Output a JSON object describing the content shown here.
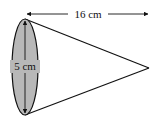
{
  "figure": {
    "type": "cone-diagram",
    "shape": "cone",
    "orientation": "lying on side, base at left, apex at right",
    "length_label": "16 cm",
    "diameter_label": "5 cm",
    "colors": {
      "base_fill": "#b8b8b8",
      "stroke": "#111111",
      "background": "#ffffff"
    }
  }
}
